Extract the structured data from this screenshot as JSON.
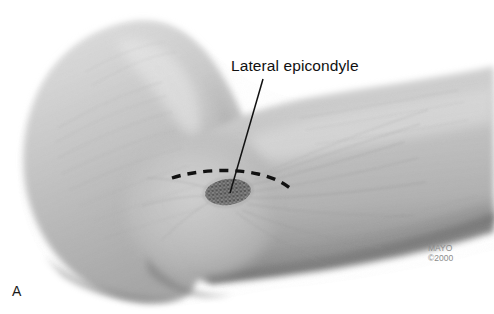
{
  "figure": {
    "panel_letter": "A",
    "background_color": "#ffffff"
  },
  "annotations": {
    "label": "Lateral epicondyle",
    "leader_line": {
      "from_x": 263,
      "from_y": 79,
      "to_x": 230,
      "to_y": 192,
      "color": "#111111"
    },
    "dashed_marking": {
      "name": "lateral-epicondyle-outline",
      "color": "#111111",
      "description": "dashed arc curving over the lateral epicondyle"
    },
    "stipple_marking": {
      "name": "epicondyle-stipple",
      "center_x": 228,
      "center_y": 192,
      "radius_x": 23,
      "radius_y": 13,
      "color": "#3d3d3d"
    }
  },
  "credit": {
    "line1": "MAYO",
    "line2": "©2000"
  },
  "palette": {
    "skin_light": "#d8d8d8",
    "skin_mid": "#b9b9b9",
    "skin_dark": "#8f8f8f",
    "shadow": "#6a6a6a",
    "highlight": "#e8e8e8",
    "ink": "#111111",
    "credit_gray": "#8c8c8c"
  }
}
